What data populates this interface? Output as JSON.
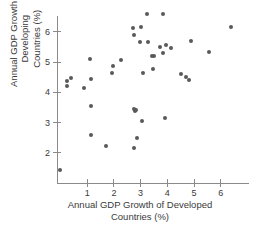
{
  "chart_data": {
    "type": "scatter",
    "title": "",
    "xlabel": "Annual GDP Growth of Developed\nCountries (%)",
    "ylabel": "Annual GDP Growth of Developing\nCountries (%)",
    "xticks": [
      1,
      2,
      3,
      4,
      5,
      6
    ],
    "yticks": [
      2,
      3,
      4,
      5,
      6
    ],
    "xlim": [
      -0.15,
      6.9
    ],
    "ylim": [
      1.2,
      6.85
    ],
    "grid": false,
    "legend": null,
    "marker": {
      "shape": "circle",
      "color": "#595959",
      "size": 4
    },
    "points": [
      {
        "x": 0.0,
        "y": 1.42
      },
      {
        "x": 0.26,
        "y": 4.36
      },
      {
        "x": 0.27,
        "y": 4.2
      },
      {
        "x": 0.42,
        "y": 4.46
      },
      {
        "x": 0.9,
        "y": 4.13
      },
      {
        "x": 1.12,
        "y": 5.09
      },
      {
        "x": 1.15,
        "y": 4.42
      },
      {
        "x": 1.17,
        "y": 3.54
      },
      {
        "x": 1.15,
        "y": 2.58
      },
      {
        "x": 1.72,
        "y": 2.22
      },
      {
        "x": 1.98,
        "y": 4.85
      },
      {
        "x": 1.95,
        "y": 4.62
      },
      {
        "x": 2.28,
        "y": 5.05
      },
      {
        "x": 2.72,
        "y": 6.1
      },
      {
        "x": 2.76,
        "y": 5.88
      },
      {
        "x": 2.78,
        "y": 3.42
      },
      {
        "x": 2.82,
        "y": 3.38
      },
      {
        "x": 2.86,
        "y": 3.4
      },
      {
        "x": 2.76,
        "y": 2.15
      },
      {
        "x": 3.05,
        "y": 6.14
      },
      {
        "x": 3.0,
        "y": 5.66
      },
      {
        "x": 3.26,
        "y": 6.58
      },
      {
        "x": 3.28,
        "y": 5.65
      },
      {
        "x": 3.1,
        "y": 4.62
      },
      {
        "x": 3.08,
        "y": 3.05
      },
      {
        "x": 2.9,
        "y": 2.48
      },
      {
        "x": 3.44,
        "y": 5.18
      },
      {
        "x": 3.52,
        "y": 5.2
      },
      {
        "x": 3.5,
        "y": 4.76
      },
      {
        "x": 3.86,
        "y": 6.58
      },
      {
        "x": 3.87,
        "y": 5.27
      },
      {
        "x": 3.76,
        "y": 5.48
      },
      {
        "x": 3.97,
        "y": 5.55
      },
      {
        "x": 3.92,
        "y": 3.15
      },
      {
        "x": 4.15,
        "y": 5.44
      },
      {
        "x": 4.52,
        "y": 4.59
      },
      {
        "x": 4.72,
        "y": 4.48
      },
      {
        "x": 4.85,
        "y": 4.39
      },
      {
        "x": 4.9,
        "y": 5.69
      },
      {
        "x": 5.59,
        "y": 5.3
      },
      {
        "x": 6.39,
        "y": 6.13
      }
    ]
  }
}
